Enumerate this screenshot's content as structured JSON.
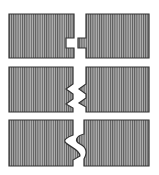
{
  "diagram": {
    "title": "",
    "colors": {
      "fill": "#a8a8a8",
      "hatch": "#555555",
      "stroke": "#333333",
      "background": "#ffffff"
    },
    "joints": [
      {
        "name": "tongue-and-groove",
        "label": ""
      },
      {
        "name": "double-tongue-and-groove",
        "label": ""
      },
      {
        "name": "s-curve-joint",
        "label": ""
      }
    ]
  }
}
